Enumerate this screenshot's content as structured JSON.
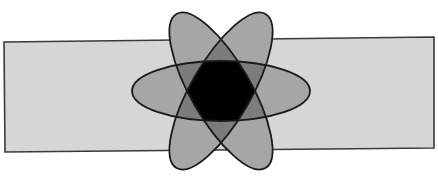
{
  "diagram": {
    "type": "three-set-venn-in-universe",
    "canvas": {
      "width": 438,
      "height": 188,
      "background": "#ffffff"
    },
    "universe": {
      "shape": "rectangle",
      "points": "4,42 434,37 434,148 5,152",
      "fill": "#d6d6d6",
      "stroke": "#3a3a3a",
      "stroke_width": 1.6
    },
    "sets": [
      {
        "name": "set-a",
        "cx": 221,
        "cy": 91,
        "rx": 89,
        "ry": 30,
        "rotation": 0
      },
      {
        "name": "set-b",
        "cx": 221,
        "cy": 91,
        "rx": 89,
        "ry": 30,
        "rotation": 60
      },
      {
        "name": "set-c",
        "cx": 221,
        "cy": 91,
        "rx": 89,
        "ry": 30,
        "rotation": -60
      }
    ],
    "region_colors": {
      "one_set": "#a6a6a6",
      "two_sets": "#7c7c7c",
      "three_sets": "#000000"
    },
    "outline": {
      "stroke": "#1a1a1a",
      "stroke_width": 1.8
    }
  }
}
